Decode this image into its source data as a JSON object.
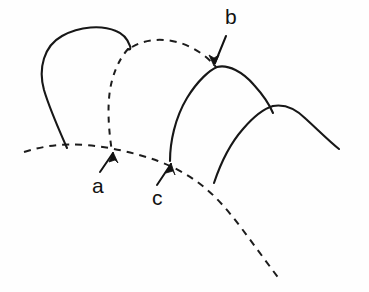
{
  "figure": {
    "background_color": "#fefefe",
    "ink_color": "#171717",
    "width": 369,
    "height": 292,
    "labels": [
      {
        "id": "a",
        "text": "a",
        "x": 92,
        "y": 175,
        "points_to": "baseline-dashed-curve at first arch right foot"
      },
      {
        "id": "b",
        "text": "b",
        "x": 225,
        "y": 6,
        "points_to": "apex junction of upper dashed arch and second solid arch"
      },
      {
        "id": "c",
        "text": "c",
        "x": 152,
        "y": 187,
        "points_to": "baseline-dashed-curve at second arch left foot"
      }
    ],
    "arrows": [
      {
        "id": "arrow-a",
        "from": [
          100,
          172
        ],
        "to": [
          113,
          152
        ],
        "direction": "up-right"
      },
      {
        "id": "arrow-b",
        "from": [
          225,
          36
        ],
        "to": [
          215,
          63
        ],
        "direction": "down-left"
      },
      {
        "id": "arrow-c",
        "from": [
          158,
          184
        ],
        "to": [
          170,
          163
        ],
        "direction": "up-right"
      }
    ],
    "strokes": [
      {
        "id": "arch-1-solid",
        "style": "solid",
        "description": "First (leftmost) arch, solid outline from baseline up over a broad flat crown down to the branch node"
      },
      {
        "id": "arch-1-dashed-leg",
        "style": "dashed",
        "description": "Hidden right leg of the first arch, dashed, descending from branch node to the baseline"
      },
      {
        "id": "upper-dashed-arch",
        "style": "dashed",
        "description": "Second arch drawn fully dashed (hidden), spanning from branch node to apex of the third arch"
      },
      {
        "id": "arch-2-solid",
        "style": "solid",
        "description": "Second solid arch rising from the baseline to the apex marked b, then descending right"
      },
      {
        "id": "arch-3-solid",
        "style": "solid",
        "description": "Third solid arch at right, overlapping the second, descending to the right edge"
      },
      {
        "id": "arch-3-left-leg",
        "style": "solid",
        "description": "Left leg of the third arch descending to meet the lower dashed curve"
      },
      {
        "id": "baseline-dashed-curve",
        "style": "dashed",
        "description": "Long dashed base curve sweeping from the left edge rightward then downward to the bottom right"
      }
    ]
  }
}
